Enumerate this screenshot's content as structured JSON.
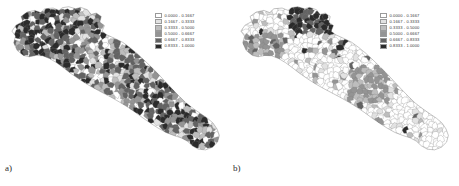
{
  "figure": {
    "type": "choropleth-map-pair",
    "region": "Puglia (Apulia), Italy",
    "unit": "municipalities"
  },
  "legend_classes": [
    {
      "label": "0.0000 - 0.1667",
      "color": "#ffffff",
      "min": 0.0,
      "max": 0.1667
    },
    {
      "label": "0.1667 - 0.3333",
      "color": "#e2e2e2",
      "min": 0.1667,
      "max": 0.3333
    },
    {
      "label": "0.3333 - 0.5000",
      "color": "#bdbdbd",
      "min": 0.3333,
      "max": 0.5
    },
    {
      "label": "0.5000 - 0.6667",
      "color": "#949494",
      "min": 0.5,
      "max": 0.6667
    },
    {
      "label": "0.6667 - 0.8333",
      "color": "#636363",
      "min": 0.6667,
      "max": 0.8333
    },
    {
      "label": "0.8333 - 1.0000",
      "color": "#2b2b2b",
      "min": 0.8333,
      "max": 1.0
    }
  ],
  "panels": [
    {
      "id": "a",
      "label": "a)",
      "legend": {
        "rows": [
          "0.0000 - 0.1667",
          "0.1667 - 0.3333",
          "0.3333 - 0.5000",
          "0.5000 - 0.6667",
          "0.6667 - 0.8333",
          "0.8333 - 1.0000"
        ]
      },
      "class_mix": [
        0.05,
        0.08,
        0.1,
        0.17,
        0.34,
        0.26
      ],
      "seed": 1847
    },
    {
      "id": "b",
      "label": "b)",
      "legend": {
        "rows": [
          "0.0000 - 0.1667",
          "0.1667 - 0.3333",
          "0.3333 - 0.5000",
          "0.5000 - 0.6667",
          "0.6667 - 0.8333",
          "0.8333 - 1.0000"
        ]
      },
      "class_mix": [
        0.7,
        0.12,
        0.07,
        0.05,
        0.03,
        0.03
      ],
      "seed": 9213
    }
  ],
  "chart_data": {
    "type": "heatmap",
    "title": "",
    "xlabel": "",
    "ylabel": "",
    "legend_position": "top-right",
    "grid": false,
    "classes": [
      "0.0000 - 0.1667",
      "0.1667 - 0.3333",
      "0.3333 - 0.5000",
      "0.5000 - 0.6667",
      "0.6667 - 0.8333",
      "0.8333 - 1.0000"
    ],
    "series": [
      {
        "name": "a)",
        "values": [
          0.05,
          0.08,
          0.1,
          0.17,
          0.34,
          0.26
        ]
      },
      {
        "name": "b)",
        "values": [
          0.7,
          0.12,
          0.07,
          0.05,
          0.03,
          0.03
        ]
      }
    ]
  }
}
